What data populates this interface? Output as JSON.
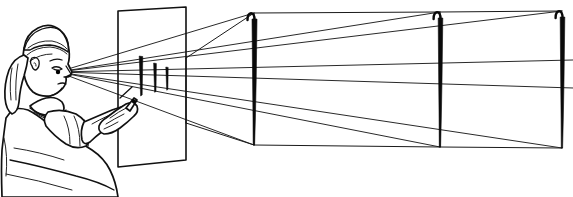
{
  "figure": {
    "title": "Linear perspective construction: artist tracing receding lamp posts on a glass picture plane",
    "domain_note": "black-and-white line drawing, no UI chrome, no visible text labels",
    "background_color": "#ffffff",
    "ink_color": "#111111",
    "post_fill_color": "#0a0a0a",
    "width": 573,
    "height": 197
  },
  "scene": {
    "observer": {
      "name": "artist",
      "description": "side-profile figure with long hair tied back, short-sleeved shirt, right arm extended forward",
      "eye_point": {
        "x": 58,
        "y": 72
      },
      "holding": "pen"
    },
    "picture_plane": {
      "name": "glass-pane",
      "description": "transparent vertical picture plane held between the artist and the scene",
      "corners": [
        {
          "x": 118,
          "y": 11
        },
        {
          "x": 186,
          "y": 7
        },
        {
          "x": 186,
          "y": 160
        },
        {
          "x": 118,
          "y": 167
        }
      ]
    },
    "traced_marks": {
      "name": "traced-post-marks",
      "description": "three short dark strokes drawn on the glass where each post's image falls",
      "count": 3,
      "items": [
        {
          "x": 141,
          "top": 56,
          "bottom": 96
        },
        {
          "x": 155,
          "top": 63,
          "bottom": 92
        },
        {
          "x": 167,
          "top": 67,
          "bottom": 90
        }
      ]
    },
    "posts": {
      "name": "lamp-posts",
      "description": "three identical hook-topped posts receding into the distance, each progressively farther away",
      "count": 3,
      "items": [
        {
          "label": "post-near",
          "x": 254,
          "top": 13,
          "bottom": 145
        },
        {
          "label": "post-middle",
          "x": 440,
          "top": 12,
          "bottom": 147
        },
        {
          "label": "post-far",
          "x": 562,
          "top": 11,
          "bottom": 148
        }
      ]
    },
    "sight_lines": {
      "name": "sight-lines",
      "description": "straight rays from the artist's eye to the top and bottom of each post, passing through the glass",
      "count": 6,
      "rays": [
        {
          "target": "post-near-top",
          "to_x": 254,
          "to_y": 13
        },
        {
          "target": "post-near-base",
          "to_x": 254,
          "to_y": 145
        },
        {
          "target": "post-middle-top",
          "to_x": 440,
          "to_y": 12
        },
        {
          "target": "post-middle-base",
          "to_x": 440,
          "to_y": 147
        },
        {
          "target": "post-far-top",
          "to_x": 562,
          "to_y": 11
        },
        {
          "target": "post-far-base",
          "to_x": 562,
          "to_y": 148
        }
      ]
    },
    "connectors": {
      "name": "post-connectors",
      "description": "light lines linking post tops and post bases, showing the receding ground and skyline",
      "top_chain": [
        [
          186,
          58
        ],
        [
          254,
          13
        ],
        [
          440,
          12
        ],
        [
          562,
          11
        ]
      ],
      "base_chain": [
        [
          186,
          123
        ],
        [
          254,
          145
        ],
        [
          440,
          147
        ],
        [
          562,
          148
        ]
      ]
    }
  }
}
